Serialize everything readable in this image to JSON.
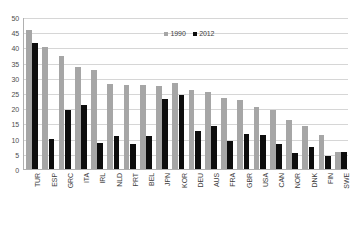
{
  "chart_data": {
    "type": "bar",
    "title": "",
    "subtitle": "",
    "xlabel": "",
    "ylabel": "",
    "ylim": [
      0,
      50
    ],
    "ytick_step": 5,
    "ytick_labels": [
      "0",
      "5",
      "10",
      "15",
      "20",
      "25",
      "30",
      "35",
      "40",
      "45",
      "50"
    ],
    "grid": true,
    "legend_position": "top-right",
    "categories": [
      "TUR",
      "ESP",
      "GRC",
      "ITA",
      "IRL",
      "NLD",
      "PRT",
      "BEL",
      "JPN",
      "KOR",
      "DEU",
      "AUS",
      "FRA",
      "GBR",
      "USA",
      "CAN",
      "NOR",
      "DNK",
      "FIN",
      "SWE"
    ],
    "series": [
      {
        "name": "1990",
        "color": "#a6a6a6",
        "values": [
          45.7,
          40.2,
          37.2,
          33.7,
          32.7,
          28.1,
          27.8,
          27.5,
          27.2,
          28.4,
          26.0,
          25.4,
          23.2,
          22.8,
          20.5,
          19.3,
          16.0,
          14.0,
          11.3,
          5.5
        ]
      },
      {
        "name": "2012",
        "color": "#0d0d0d",
        "values": [
          41.4,
          10.0,
          19.4,
          20.9,
          8.5,
          10.7,
          8.2,
          10.7,
          22.9,
          24.3,
          12.4,
          14.1,
          9.1,
          11.5,
          11.2,
          8.2,
          5.2,
          7.1,
          4.3,
          5.5
        ]
      }
    ]
  },
  "legend": {
    "items": [
      {
        "label": "1990",
        "color": "#a6a6a6"
      },
      {
        "label": "2012",
        "color": "#0d0d0d"
      }
    ]
  }
}
